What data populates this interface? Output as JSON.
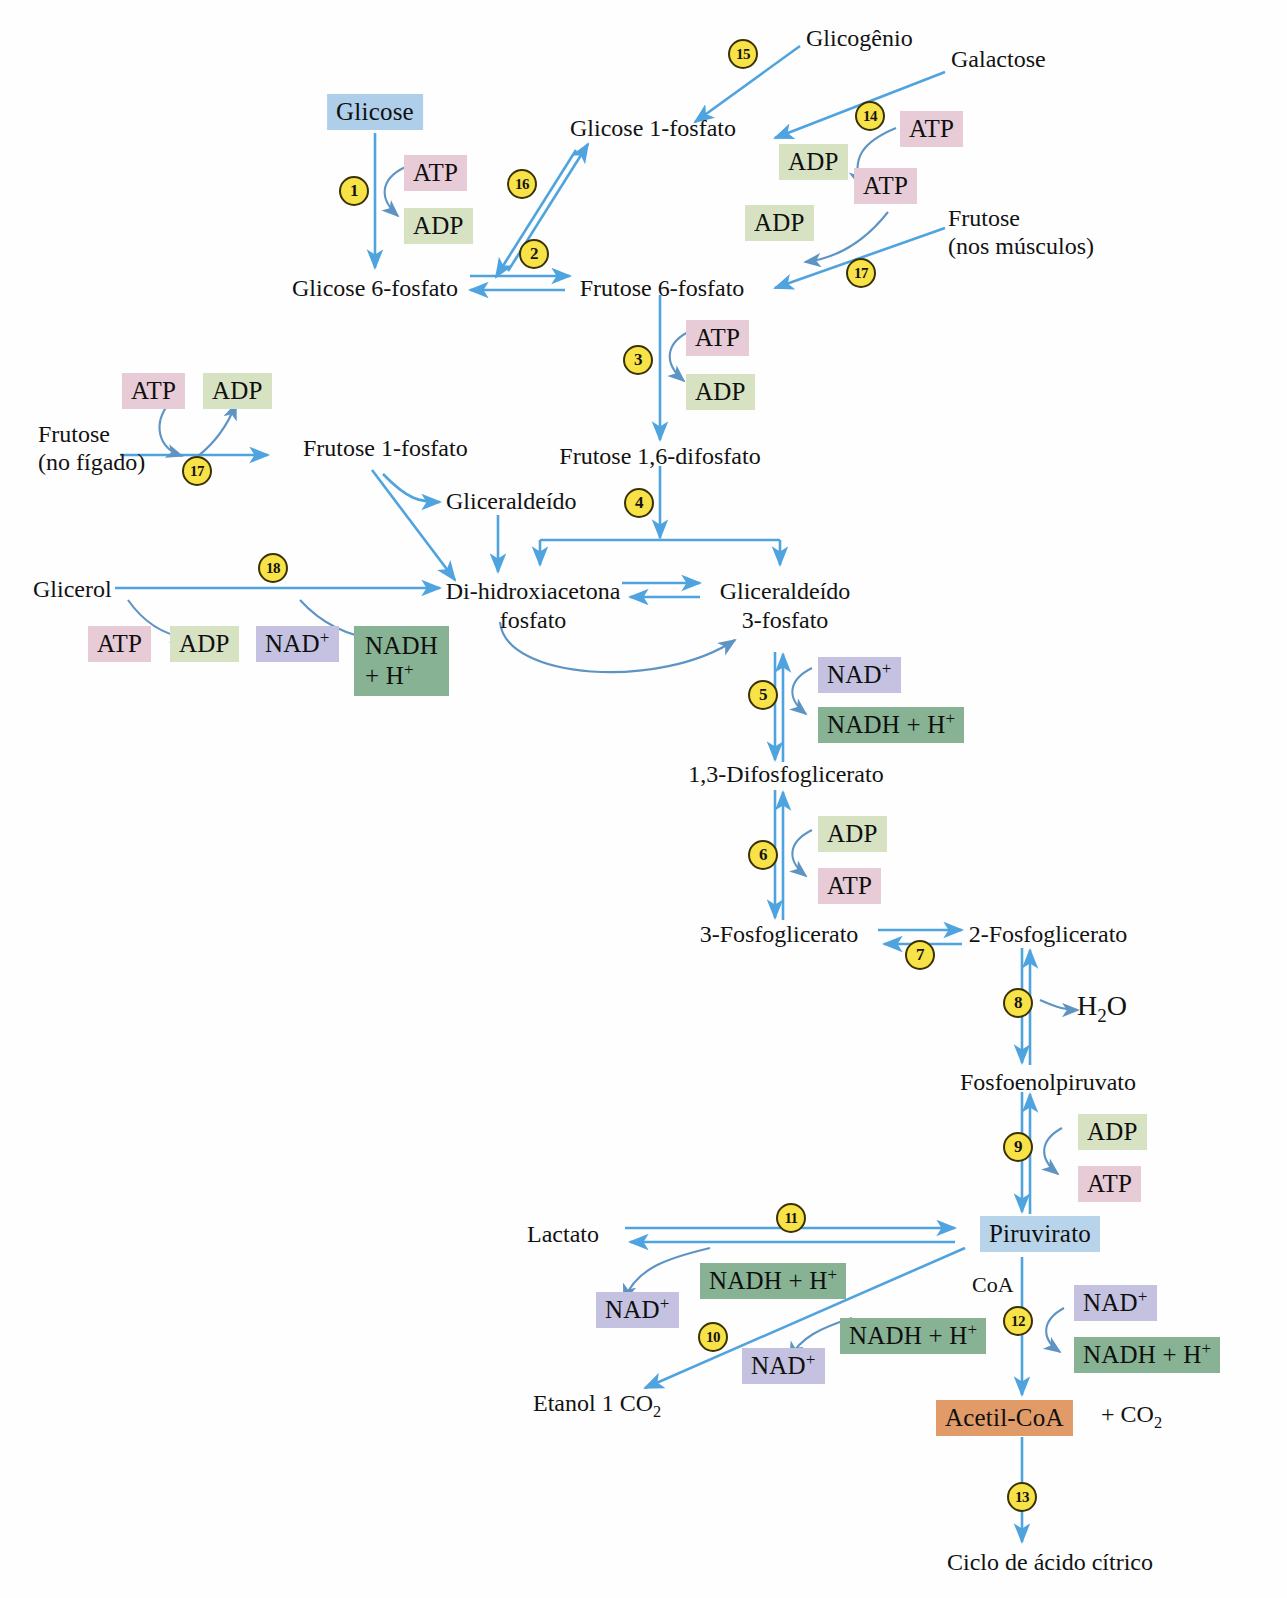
{
  "diagram": {
    "language": "pt-BR",
    "colors": {
      "arrow": "#5aa7dd",
      "curve": "#5d94c4",
      "atp": "#e7cbd6",
      "adp": "#d7e2c2",
      "nad": "#c4c2e0",
      "nadh": "#87b294",
      "glucose": "#aeceea",
      "pyruvate": "#b7d4ea",
      "acetylcoa": "#e09b68",
      "step_circle": "#f7e247",
      "text": "#121212"
    }
  },
  "metabolites": {
    "glicose": "Glicose",
    "glicose_6_fosfato": "Glicose 6-fosfato",
    "glicose_1_fosfato": "Glicose 1-fosfato",
    "glicogenio": "Glicogênio",
    "galactose": "Galactose",
    "frutose_6_fosfato": "Frutose 6-fosfato",
    "frutose_musculos_l1": "Frutose",
    "frutose_musculos_l2": "(nos músculos)",
    "frutose_figado_l1": "Frutose",
    "frutose_figado_l2": "(no fígado)",
    "frutose_1_fosfato": "Frutose 1-fosfato",
    "frutose_16_difosfato": "Frutose 1,6-difosfato",
    "gliceraldeido": "Gliceraldeído",
    "glicerol": "Glicerol",
    "dihidroxiacetona_l1": "Di-hidroxiacetona",
    "dihidroxiacetona_l2": "fosfato",
    "gliceraldeido3p_l1": "Gliceraldeído",
    "gliceraldeido3p_l2": "3-fosfato",
    "difosfoglicerato_13": "1,3-Difosfoglicerato",
    "fosfoglicerato_3": "3-Fosfoglicerato",
    "fosfoglicerato_2": "2-Fosfoglicerato",
    "agua": "H2O",
    "fosfoenolpiruvato": "Fosfoenolpiruvato",
    "piruvirato": "Piruvirato",
    "lactato": "Lactato",
    "coa": "CoA",
    "etanol_co2": "Etanol 1 CO2",
    "acetil_coa": "Acetil-CoA",
    "mais_co2": "+ CO2",
    "ciclo_citrico": "Ciclo de ácido cítrico"
  },
  "cofactors": {
    "atp": "ATP",
    "adp": "ADP",
    "nad": "NAD+",
    "nadh": "NADH + H+",
    "nadh_two_line_l1": "NADH",
    "nadh_two_line_l2": "+ H+"
  },
  "steps": [
    {
      "id": 1,
      "label": "1"
    },
    {
      "id": 2,
      "label": "2"
    },
    {
      "id": 3,
      "label": "3"
    },
    {
      "id": 4,
      "label": "4"
    },
    {
      "id": 5,
      "label": "5"
    },
    {
      "id": 6,
      "label": "6"
    },
    {
      "id": 7,
      "label": "7"
    },
    {
      "id": 8,
      "label": "8"
    },
    {
      "id": 9,
      "label": "9"
    },
    {
      "id": 10,
      "label": "10"
    },
    {
      "id": 11,
      "label": "11"
    },
    {
      "id": 12,
      "label": "12"
    },
    {
      "id": 13,
      "label": "13"
    },
    {
      "id": 14,
      "label": "14"
    },
    {
      "id": 15,
      "label": "15"
    },
    {
      "id": 16,
      "label": "16"
    },
    {
      "id": 17,
      "label": "17"
    },
    {
      "id": 18,
      "label": "18"
    }
  ],
  "step_occurrences": {
    "s1": "1",
    "s2": "2",
    "s3": "3",
    "s4": "4",
    "s5": "5",
    "s6": "6",
    "s7": "7",
    "s8": "8",
    "s9": "9",
    "s10": "10",
    "s11": "11",
    "s12": "12",
    "s13": "13",
    "s14": "14",
    "s15": "15",
    "s16": "16",
    "s17a": "17",
    "s17b": "17",
    "s18": "18"
  }
}
